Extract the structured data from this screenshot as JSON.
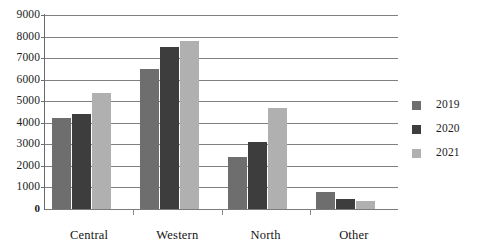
{
  "chart_data": {
    "type": "bar",
    "title": "",
    "subtitle": "",
    "xlabel": "",
    "ylabel": "",
    "categories": [
      "Central",
      "Western",
      "North",
      "Other"
    ],
    "series": [
      {
        "name": "2019",
        "color": "#6e6e6e",
        "values": [
          4200,
          6500,
          2400,
          800
        ]
      },
      {
        "name": "2020",
        "color": "#3d3d3d",
        "values": [
          4400,
          7500,
          3100,
          450
        ]
      },
      {
        "name": "2021",
        "color": "#b0b0b0",
        "values": [
          5400,
          7800,
          4700,
          350
        ]
      }
    ],
    "ylim": [
      0,
      9000
    ],
    "y_ticks": [
      0,
      1000,
      2000,
      3000,
      4000,
      5000,
      6000,
      7000,
      8000,
      9000
    ],
    "y_tick_labels": [
      "0",
      "1000",
      "2000",
      "3000",
      "4000",
      "5000",
      "6000",
      "7000",
      "8000",
      "9000"
    ],
    "grid": true,
    "grid_axis": "y",
    "legend_position": "right",
    "legend_entries": [
      "2019",
      "2020",
      "2021"
    ],
    "background_color": "#ffffff",
    "gridline_color": "#808080",
    "axis_color": "#6a6a6a"
  }
}
